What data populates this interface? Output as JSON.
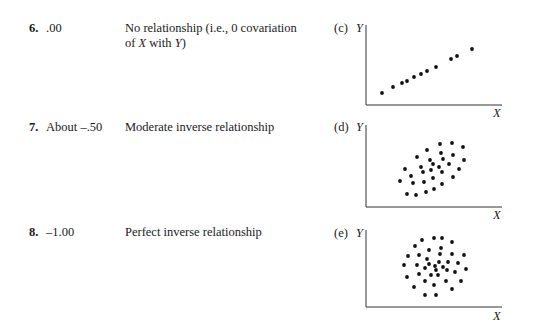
{
  "rows": [
    {
      "number": "6.",
      "value": ".00",
      "description_line1": "No relationship (i.e., 0 covariation",
      "description_line2_pre": "of ",
      "description_line2_x": "X",
      "description_line2_mid": " with ",
      "description_line2_y": "Y",
      "description_line2_post": ")",
      "plot_label": "(c)"
    },
    {
      "number": "7.",
      "value": "About –.50",
      "description_line1": "Moderate inverse relationship",
      "plot_label": "(d)"
    },
    {
      "number": "8.",
      "value": "–1.00",
      "description_line1": "Perfect inverse relationship",
      "plot_label": "(e)"
    }
  ],
  "axis_labels": {
    "y": "Y",
    "x": "X"
  },
  "chart_data": [
    {
      "type": "scatter",
      "title": "(c)",
      "xlabel": "X",
      "ylabel": "Y",
      "grid": false,
      "points": [
        [
          382,
          93
        ],
        [
          393,
          87
        ],
        [
          402,
          83
        ],
        [
          407,
          81
        ],
        [
          414,
          77
        ],
        [
          421,
          74
        ],
        [
          427,
          71
        ],
        [
          436,
          67
        ],
        [
          451,
          59
        ],
        [
          457,
          56
        ],
        [
          472,
          49
        ]
      ]
    },
    {
      "type": "scatter",
      "title": "(d)",
      "xlabel": "X",
      "ylabel": "Y",
      "grid": false,
      "points": [
        [
          440,
          144
        ],
        [
          452,
          143
        ],
        [
          463,
          147
        ],
        [
          417,
          157
        ],
        [
          427,
          150
        ],
        [
          441,
          153
        ],
        [
          453,
          155
        ],
        [
          464,
          160
        ],
        [
          430,
          160
        ],
        [
          443,
          159
        ],
        [
          405,
          169
        ],
        [
          421,
          167
        ],
        [
          433,
          164
        ],
        [
          439,
          167
        ],
        [
          449,
          164
        ],
        [
          459,
          169
        ],
        [
          423,
          172
        ],
        [
          431,
          170
        ],
        [
          442,
          172
        ],
        [
          411,
          176
        ],
        [
          433,
          178
        ],
        [
          453,
          177
        ],
        [
          400,
          181
        ],
        [
          413,
          183
        ],
        [
          424,
          182
        ],
        [
          442,
          184
        ],
        [
          407,
          194
        ],
        [
          416,
          195
        ],
        [
          426,
          192
        ],
        [
          434,
          189
        ]
      ]
    },
    {
      "type": "scatter",
      "title": "(e)",
      "xlabel": "X",
      "ylabel": "Y",
      "grid": false,
      "points": [
        [
          422,
          240
        ],
        [
          434,
          238
        ],
        [
          442,
          238
        ],
        [
          452,
          242
        ],
        [
          415,
          246
        ],
        [
          429,
          250
        ],
        [
          441,
          248
        ],
        [
          408,
          256
        ],
        [
          419,
          255
        ],
        [
          440,
          254
        ],
        [
          452,
          254
        ],
        [
          464,
          255
        ],
        [
          427,
          259
        ],
        [
          404,
          265
        ],
        [
          417,
          265
        ],
        [
          429,
          264
        ],
        [
          439,
          262
        ],
        [
          448,
          262
        ],
        [
          458,
          263
        ],
        [
          425,
          268
        ],
        [
          435,
          266
        ],
        [
          443,
          267
        ],
        [
          466,
          269
        ],
        [
          436,
          270
        ],
        [
          447,
          270
        ],
        [
          419,
          274
        ],
        [
          455,
          272
        ],
        [
          407,
          277
        ],
        [
          431,
          275
        ],
        [
          438,
          275
        ],
        [
          425,
          281
        ],
        [
          446,
          281
        ],
        [
          461,
          281
        ],
        [
          414,
          287
        ],
        [
          434,
          285
        ],
        [
          452,
          289
        ],
        [
          425,
          295
        ],
        [
          436,
          295
        ]
      ]
    }
  ]
}
